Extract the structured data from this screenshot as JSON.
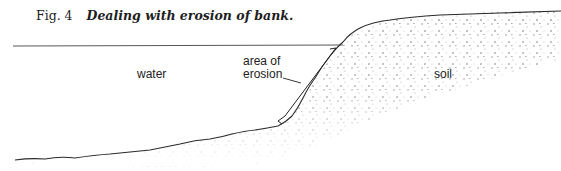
{
  "figure": {
    "number": "Fig. 4",
    "title": "Dealing with erosion of bank."
  },
  "labels": {
    "water": "water",
    "erosion_line1": "area of",
    "erosion_line2": "erosion",
    "soil": "soil"
  },
  "colors": {
    "ink": "#2a2a2a",
    "stipple": "#8a8a8a",
    "background": "#ffffff"
  }
}
